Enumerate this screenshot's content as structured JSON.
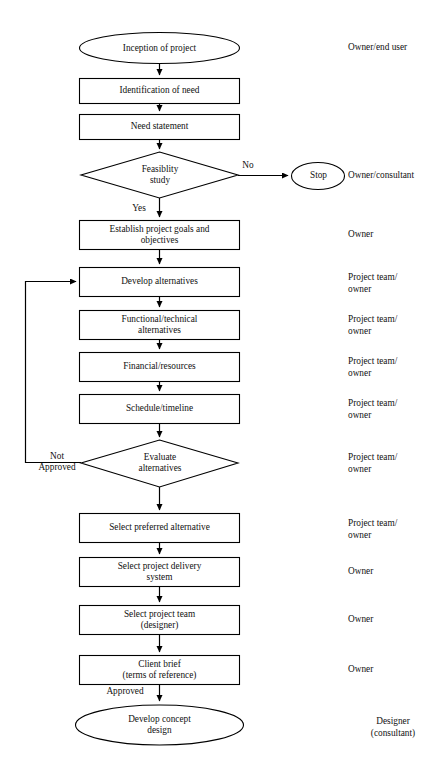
{
  "diagram": {
    "background_color": "#ffffff",
    "line_color": "#000000",
    "text_color": "#111111"
  },
  "nodes": [
    {
      "id": "inception",
      "shape": "ellipse",
      "label": "Inception of project"
    },
    {
      "id": "identify",
      "shape": "rectangle",
      "label": "Identification of need"
    },
    {
      "id": "need",
      "shape": "rectangle",
      "label": "Need statement"
    },
    {
      "id": "feasibility",
      "shape": "diamond",
      "label": "Feasiblity\nstudy"
    },
    {
      "id": "stop",
      "shape": "ellipse",
      "label": "Stop"
    },
    {
      "id": "goals",
      "shape": "rectangle",
      "label": "Establish project goals and\nobjectives"
    },
    {
      "id": "develop",
      "shape": "rectangle",
      "label": "Develop alternatives"
    },
    {
      "id": "functional",
      "shape": "rectangle",
      "label": "Functional/technical\nalternatives"
    },
    {
      "id": "financial",
      "shape": "rectangle",
      "label": "Financial/resources"
    },
    {
      "id": "schedule",
      "shape": "rectangle",
      "label": "Schedule/timeline"
    },
    {
      "id": "evaluate",
      "shape": "diamond",
      "label": "Evaluate\nalternatives"
    },
    {
      "id": "preferred",
      "shape": "rectangle",
      "label": "Select preferred alternative"
    },
    {
      "id": "delivery",
      "shape": "rectangle",
      "label": "Select project delivery\nsystem"
    },
    {
      "id": "team",
      "shape": "rectangle",
      "label": "Select project team\n(designer)"
    },
    {
      "id": "brief",
      "shape": "rectangle",
      "label": "Client brief\n(terms of reference)"
    },
    {
      "id": "concept",
      "shape": "ellipse",
      "label": "Develop concept\ndesign"
    }
  ],
  "edge_labels": [
    {
      "id": "no",
      "label": "No"
    },
    {
      "id": "yes",
      "label": "Yes"
    },
    {
      "id": "not-approved",
      "label": "Not\nApproved"
    },
    {
      "id": "approved",
      "label": "Approved"
    }
  ],
  "roles": [
    {
      "id": "role-inception",
      "label": "Owner/end user"
    },
    {
      "id": "role-stop",
      "label": "Owner/consultant"
    },
    {
      "id": "role-goals",
      "label": "Owner"
    },
    {
      "id": "role-develop",
      "label": "Project team/\nowner"
    },
    {
      "id": "role-functional",
      "label": "Project team/\nowner"
    },
    {
      "id": "role-financial",
      "label": "Project team/\nowner"
    },
    {
      "id": "role-schedule",
      "label": "Project team/\nowner"
    },
    {
      "id": "role-evaluate",
      "label": "Project team/\nowner"
    },
    {
      "id": "role-preferred",
      "label": "Project team/\nowner"
    },
    {
      "id": "role-delivery",
      "label": "Owner"
    },
    {
      "id": "role-team",
      "label": "Owner"
    },
    {
      "id": "role-brief",
      "label": "Owner"
    },
    {
      "id": "role-concept",
      "label": "Designer\n(consultant)"
    }
  ]
}
